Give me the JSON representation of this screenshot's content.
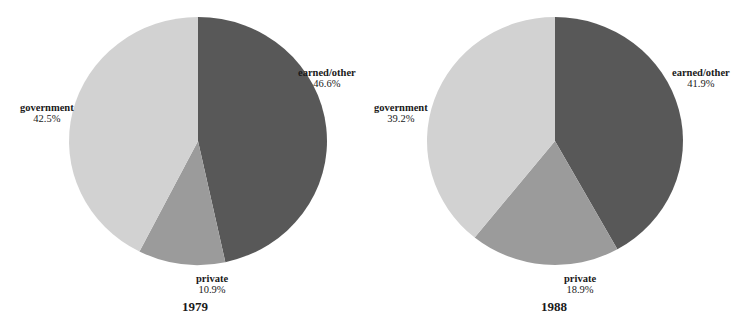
{
  "colors": {
    "earned_other": "#585858",
    "private": "#9b9b9b",
    "government": "#d2d2d2"
  },
  "chart_data": [
    {
      "type": "pie",
      "title": "1979",
      "slices": [
        {
          "label": "earned/other",
          "value": 46.6,
          "display": "46.6%",
          "color": "#585858"
        },
        {
          "label": "private",
          "value": 10.9,
          "display": "10.9%",
          "color": "#9b9b9b"
        },
        {
          "label": "government",
          "value": 42.5,
          "display": "42.5%",
          "color": "#d2d2d2"
        }
      ],
      "start_angle": "12 o'clock",
      "direction": "clockwise"
    },
    {
      "type": "pie",
      "title": "1988",
      "slices": [
        {
          "label": "earned/other",
          "value": 41.9,
          "display": "41.9%",
          "color": "#585858"
        },
        {
          "label": "private",
          "value": 18.9,
          "display": "18.9%",
          "color": "#9b9b9b"
        },
        {
          "label": "government",
          "value": 39.2,
          "display": "39.2%",
          "color": "#d2d2d2"
        }
      ],
      "start_angle": "12 o'clock",
      "direction": "clockwise"
    }
  ]
}
